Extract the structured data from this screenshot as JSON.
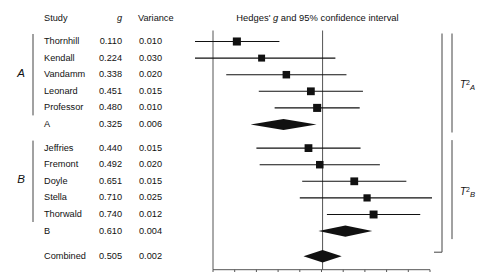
{
  "header": {
    "col_study": "Study",
    "col_g": "g",
    "col_variance": "Variance",
    "plot_title": "Hedges' g and 95% confidence interval"
  },
  "groups": [
    {
      "label": "A",
      "t2_label": "T",
      "t2_exp": "2",
      "t2_sub": "A"
    },
    {
      "label": "B",
      "t2_label": "T",
      "t2_exp": "2",
      "t2_sub": "B"
    }
  ],
  "rows": [
    {
      "study": "Thornhill",
      "g": "0.110",
      "variance": "0.010",
      "kind": "study",
      "group": "A"
    },
    {
      "study": "Kendall",
      "g": "0.224",
      "variance": "0.030",
      "kind": "study",
      "group": "A"
    },
    {
      "study": "Vandamm",
      "g": "0.338",
      "variance": "0.020",
      "kind": "study",
      "group": "A"
    },
    {
      "study": "Leonard",
      "g": "0.451",
      "variance": "0.015",
      "kind": "study",
      "group": "A"
    },
    {
      "study": "Professor",
      "g": "0.480",
      "variance": "0.010",
      "kind": "study",
      "group": "A"
    },
    {
      "study": "A",
      "g": "0.325",
      "variance": "0.006",
      "kind": "subtotal",
      "group": "A"
    },
    {
      "study": "Jeffries",
      "g": "0.440",
      "variance": "0.015",
      "kind": "study",
      "group": "B"
    },
    {
      "study": "Fremont",
      "g": "0.492",
      "variance": "0.020",
      "kind": "study",
      "group": "B"
    },
    {
      "study": "Doyle",
      "g": "0.651",
      "variance": "0.015",
      "kind": "study",
      "group": "B"
    },
    {
      "study": "Stella",
      "g": "0.710",
      "variance": "0.025",
      "kind": "study",
      "group": "B"
    },
    {
      "study": "Thorwald",
      "g": "0.740",
      "variance": "0.012",
      "kind": "study",
      "group": "B"
    },
    {
      "study": "B",
      "g": "0.610",
      "variance": "0.004",
      "kind": "subtotal",
      "group": "B"
    },
    {
      "study": "Combined",
      "g": "0.505",
      "variance": "0.002",
      "kind": "overall",
      "group": ""
    }
  ],
  "axis": {
    "ticks": [
      "0.0",
      "0.1",
      "0.2",
      "0.3",
      "0.4",
      "0.5",
      "0.6",
      "0.7",
      "0.8",
      "0.9",
      "1.0"
    ],
    "min": 0.0,
    "max": 1.0
  },
  "colors": {
    "marker": "#111111",
    "line": "#111111",
    "axis": "#555555",
    "text": "#111111"
  },
  "chart_data": {
    "type": "forest",
    "title": "Hedges' g and 95% confidence interval",
    "xlabel": "",
    "ylabel": "",
    "xlim": [
      0.0,
      1.0
    ],
    "xticks": [
      0.0,
      0.1,
      0.2,
      0.3,
      0.4,
      0.5,
      0.6,
      0.7,
      0.8,
      0.9,
      1.0
    ],
    "grid": false,
    "reference_lines": [
      0.0,
      0.505
    ],
    "columns": [
      "Study",
      "g",
      "Variance"
    ],
    "entries": [
      {
        "study": "Thornhill",
        "g": 0.11,
        "variance": 0.01,
        "ci_low": -0.086,
        "ci_high": 0.306,
        "group": "A",
        "type": "study"
      },
      {
        "study": "Kendall",
        "g": 0.224,
        "variance": 0.03,
        "ci_low": -0.115,
        "ci_high": 0.564,
        "group": "A",
        "type": "study"
      },
      {
        "study": "Vandamm",
        "g": 0.338,
        "variance": 0.02,
        "ci_low": 0.061,
        "ci_high": 0.615,
        "group": "A",
        "type": "study"
      },
      {
        "study": "Leonard",
        "g": 0.451,
        "variance": 0.015,
        "ci_low": 0.211,
        "ci_high": 0.691,
        "group": "A",
        "type": "study"
      },
      {
        "study": "Professor",
        "g": 0.48,
        "variance": 0.01,
        "ci_low": 0.284,
        "ci_high": 0.676,
        "group": "A",
        "type": "study"
      },
      {
        "study": "A",
        "g": 0.325,
        "variance": 0.006,
        "ci_low": 0.173,
        "ci_high": 0.477,
        "group": "A",
        "type": "subtotal"
      },
      {
        "study": "Jeffries",
        "g": 0.44,
        "variance": 0.015,
        "ci_low": 0.2,
        "ci_high": 0.68,
        "group": "B",
        "type": "study"
      },
      {
        "study": "Fremont",
        "g": 0.492,
        "variance": 0.02,
        "ci_low": 0.215,
        "ci_high": 0.769,
        "group": "B",
        "type": "study"
      },
      {
        "study": "Doyle",
        "g": 0.651,
        "variance": 0.015,
        "ci_low": 0.411,
        "ci_high": 0.891,
        "group": "B",
        "type": "study"
      },
      {
        "study": "Stella",
        "g": 0.71,
        "variance": 0.025,
        "ci_low": 0.4,
        "ci_high": 1.02,
        "group": "B",
        "type": "study"
      },
      {
        "study": "Thorwald",
        "g": 0.74,
        "variance": 0.012,
        "ci_low": 0.525,
        "ci_high": 0.955,
        "group": "B",
        "type": "study"
      },
      {
        "study": "B",
        "g": 0.61,
        "variance": 0.004,
        "ci_low": 0.486,
        "ci_high": 0.734,
        "group": "B",
        "type": "subtotal"
      },
      {
        "study": "Combined",
        "g": 0.505,
        "variance": 0.002,
        "ci_low": 0.417,
        "ci_high": 0.593,
        "group": "",
        "type": "overall"
      }
    ],
    "annotations": [
      {
        "text": "T2A",
        "meaning": "between-study variance for subgroup A"
      },
      {
        "text": "T2B",
        "meaning": "between-study variance for subgroup B"
      }
    ]
  }
}
